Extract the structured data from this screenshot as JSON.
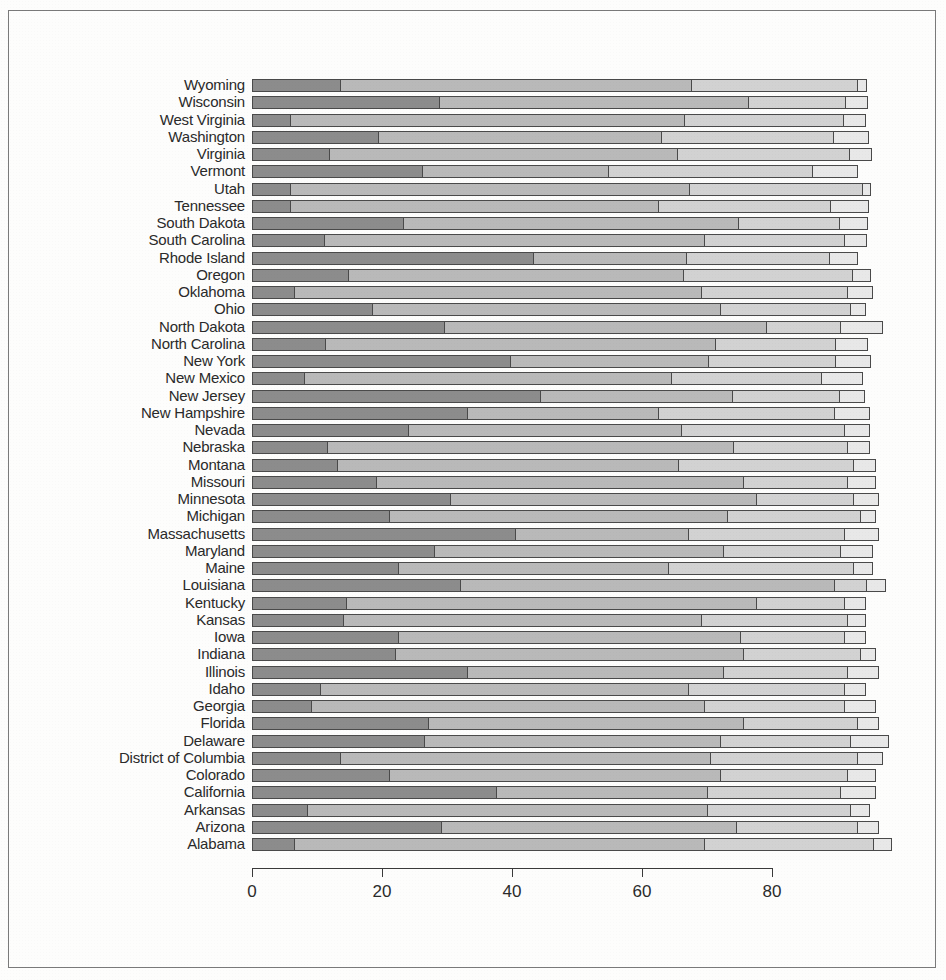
{
  "chart_data": {
    "type": "bar",
    "orientation": "horizontal",
    "stacked": true,
    "title": "",
    "xlabel": "",
    "ylabel": "",
    "xlim": [
      0,
      100
    ],
    "grid": false,
    "legend": "none",
    "xticks": [
      0,
      20,
      40,
      60,
      80
    ],
    "xticklabels": [
      "0",
      "20",
      "40",
      "60",
      "80"
    ],
    "colors": [
      "#8c8c8c",
      "#b9b9b9",
      "#d2d2d2",
      "#e8e8e8"
    ],
    "series": [
      {
        "name": "segment-1",
        "color": "#8c8c8c"
      },
      {
        "name": "segment-2",
        "color": "#b9b9b9"
      },
      {
        "name": "segment-3",
        "color": "#d2d2d2"
      },
      {
        "name": "segment-4",
        "color": "#e8e8e8"
      }
    ],
    "categories": [
      "Wyoming",
      "Wisconsin",
      "West Virginia",
      "Washington",
      "Virginia",
      "Vermont",
      "Utah",
      "Tennessee",
      "South Dakota",
      "South Carolina",
      "Rhode Island",
      "Oregon",
      "Oklahoma",
      "Ohio",
      "North Dakota",
      "North Carolina",
      "New York",
      "New Mexico",
      "New Jersey",
      "New Hampshire",
      "Nevada",
      "Nebraska",
      "Montana",
      "Missouri",
      "Minnesota",
      "Michigan",
      "Massachusetts",
      "Maryland",
      "Maine",
      "Louisiana",
      "Kentucky",
      "Kansas",
      "Iowa",
      "Indiana",
      "Illinois",
      "Idaho",
      "Georgia",
      "Florida",
      "Delaware",
      "District of Columbia",
      "Colorado",
      "California",
      "Arkansas",
      "Arizona",
      "Alabama"
    ],
    "values": [
      [
        13.6,
        54.0,
        25.5,
        1.5
      ],
      [
        28.8,
        47.5,
        15.0,
        3.5
      ],
      [
        5.9,
        60.5,
        24.5,
        3.5
      ],
      [
        19.4,
        43.5,
        26.5,
        5.5
      ],
      [
        11.9,
        53.5,
        26.5,
        3.5
      ],
      [
        26.2,
        28.5,
        31.5,
        7.0
      ],
      [
        5.8,
        61.5,
        26.5,
        1.5
      ],
      [
        5.9,
        56.5,
        26.5,
        6.0
      ],
      [
        23.3,
        51.5,
        15.5,
        4.5
      ],
      [
        11.1,
        58.5,
        21.5,
        3.5
      ],
      [
        43.3,
        23.5,
        22.0,
        4.5
      ],
      [
        14.8,
        51.5,
        26.0,
        3.0
      ],
      [
        6.5,
        62.5,
        22.5,
        4.0
      ],
      [
        18.5,
        53.5,
        20.0,
        2.5
      ],
      [
        29.5,
        49.5,
        11.5,
        6.5
      ],
      [
        11.2,
        60.0,
        18.5,
        5.0
      ],
      [
        39.7,
        30.5,
        19.5,
        5.5
      ],
      [
        8.0,
        56.5,
        23.0,
        6.5
      ],
      [
        44.3,
        29.5,
        16.5,
        4.0
      ],
      [
        33.0,
        29.5,
        27.0,
        5.5
      ],
      [
        24.0,
        42.0,
        25.0,
        4.0
      ],
      [
        11.5,
        62.5,
        17.5,
        3.5
      ],
      [
        13.0,
        52.5,
        27.0,
        3.5
      ],
      [
        19.0,
        56.5,
        16.0,
        4.5
      ],
      [
        30.5,
        47.0,
        15.0,
        4.0
      ],
      [
        21.0,
        52.0,
        20.5,
        2.5
      ],
      [
        40.5,
        26.5,
        24.0,
        5.5
      ],
      [
        28.0,
        44.5,
        18.0,
        5.0
      ],
      [
        22.5,
        41.5,
        28.5,
        3.0
      ],
      [
        32.0,
        57.5,
        5.0,
        3.0
      ],
      [
        14.5,
        63.0,
        13.5,
        3.5
      ],
      [
        14.0,
        55.0,
        22.5,
        3.0
      ],
      [
        22.5,
        52.5,
        16.0,
        3.5
      ],
      [
        22.0,
        53.5,
        18.0,
        2.5
      ],
      [
        33.0,
        39.5,
        19.0,
        5.0
      ],
      [
        10.5,
        56.5,
        24.0,
        3.5
      ],
      [
        9.0,
        60.5,
        21.5,
        5.0
      ],
      [
        27.0,
        48.5,
        17.5,
        3.5
      ],
      [
        26.5,
        45.5,
        20.0,
        6.0
      ],
      [
        13.5,
        57.0,
        22.5,
        4.0
      ],
      [
        21.0,
        51.0,
        19.5,
        4.5
      ],
      [
        37.5,
        32.5,
        20.5,
        5.5
      ],
      [
        8.5,
        61.5,
        22.0,
        3.0
      ],
      [
        29.0,
        45.5,
        18.5,
        3.5
      ],
      [
        6.5,
        63.0,
        26.0,
        3.0
      ]
    ]
  }
}
